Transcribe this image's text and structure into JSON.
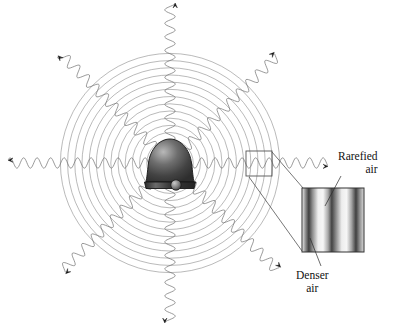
{
  "figure": {
    "background_color": "#ffffff",
    "width": 404,
    "height": 327
  },
  "source": {
    "name": "bell",
    "description": "shaded bell with clapper at center of wavefronts",
    "center_x": 170,
    "center_y": 163,
    "body_width": 40,
    "body_height": 48,
    "fill_dark": "#3a3a3a",
    "fill_light": "#b9b9b9",
    "outline_color": "#1a1a1a"
  },
  "wavefronts": {
    "name": "concentric-circles",
    "center_x": 170,
    "center_y": 163,
    "count": 14,
    "first_radius": 16,
    "spacing": 7.2,
    "stroke_color": "#8c8c8c",
    "stroke_width": 0.6
  },
  "rays": {
    "count": 8,
    "stroke_color": "#6f6f6f",
    "stroke_width": 0.7,
    "arrow_color": "#111111",
    "items": [
      {
        "label": "ray-left",
        "angle_deg": 180,
        "inner_radius": 8,
        "outer_radius": 162,
        "amplitude": 5.2,
        "wavelength": 13.5
      },
      {
        "label": "ray-up-left",
        "angle_deg": 225,
        "inner_radius": 8,
        "outer_radius": 155,
        "amplitude": 5.2,
        "wavelength": 13.5
      },
      {
        "label": "ray-up",
        "angle_deg": 270,
        "inner_radius": 8,
        "outer_radius": 160,
        "amplitude": 5.2,
        "wavelength": 13.5
      },
      {
        "label": "ray-up-right",
        "angle_deg": 315,
        "inner_radius": 8,
        "outer_radius": 152,
        "amplitude": 5.2,
        "wavelength": 13.5
      },
      {
        "label": "ray-right",
        "angle_deg": 0,
        "inner_radius": 8,
        "outer_radius": 158,
        "amplitude": 5.2,
        "wavelength": 13.5
      },
      {
        "label": "ray-down-right",
        "angle_deg": 45,
        "inner_radius": 8,
        "outer_radius": 152,
        "amplitude": 5.2,
        "wavelength": 13.5
      },
      {
        "label": "ray-down",
        "angle_deg": 90,
        "inner_radius": 8,
        "outer_radius": 160,
        "amplitude": 5.2,
        "wavelength": 13.5
      },
      {
        "label": "ray-down-left",
        "angle_deg": 135,
        "inner_radius": 8,
        "outer_radius": 152,
        "amplitude": 5.2,
        "wavelength": 13.5
      }
    ]
  },
  "selection_box": {
    "name": "magnifier-selection-box",
    "x": 246,
    "y": 151,
    "width": 26,
    "height": 25,
    "stroke_color": "#555555",
    "stroke_width": 0.9
  },
  "detail_box": {
    "name": "magnified-air-density-box",
    "x": 302,
    "y": 188,
    "width": 62,
    "height": 64,
    "stroke_color": "#333333",
    "stroke_width": 1,
    "band_count": 3,
    "band_dark_color": "#3d3d3d",
    "band_light_color": "#f2f2f2",
    "description": "alternating dark and light vertical bands representing compressions and rarefactions of air"
  },
  "connectors": [
    {
      "name": "connector-top",
      "x1": 272,
      "y1": 152,
      "x2": 303,
      "y2": 188
    },
    {
      "name": "connector-bottom",
      "x1": 249,
      "y1": 177,
      "x2": 302,
      "y2": 251
    }
  ],
  "callouts": [
    {
      "name": "rarefied-air-callout",
      "line1": "Rarefied",
      "line2": "air",
      "leader": {
        "x1": 341,
        "y1": 176,
        "x2": 325,
        "y2": 206
      }
    },
    {
      "name": "denser-air-callout",
      "line1": "Denser",
      "line2": "air",
      "leader": {
        "x1": 321,
        "y1": 266,
        "x2": 310,
        "y2": 238
      }
    }
  ]
}
